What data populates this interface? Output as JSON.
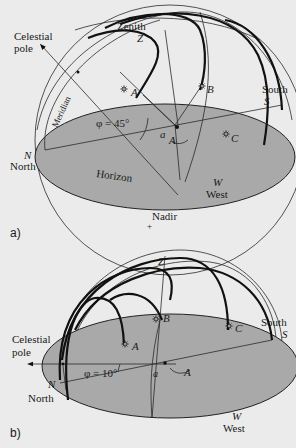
{
  "figure": {
    "background": "#ebebeb",
    "horizon_fill": "#a9a9a9",
    "panels": [
      {
        "id": "a",
        "panel_label": "a)",
        "latitude_label": "φ = 45°",
        "labels": {
          "celestial_pole": [
            "Celestial",
            "pole"
          ],
          "zenith": "Zenith",
          "zenith_symbol": "Z",
          "meridian": "Meridian",
          "horizon": "Horizon",
          "north_symbol": "N",
          "north": "North",
          "south": "South",
          "south_symbol": "S",
          "west_symbol": "W",
          "west": "West",
          "nadir": "Nadir",
          "altitude_symbol": "a",
          "azimuth_symbol": "A",
          "star_a": "A",
          "star_b": "B",
          "star_c": "C"
        }
      },
      {
        "id": "b",
        "panel_label": "b)",
        "latitude_label": "φ = 10°",
        "labels": {
          "celestial_pole": [
            "Celestial",
            "pole"
          ],
          "zenith_symbol": "Z",
          "north_symbol": "N",
          "north": "North",
          "south": "South",
          "south_symbol": "S",
          "west_symbol": "W",
          "west": "West",
          "altitude_symbol": "a",
          "azimuth_symbol": "A",
          "star_a": "A",
          "star_b": "B",
          "star_c": "C"
        }
      }
    ]
  }
}
